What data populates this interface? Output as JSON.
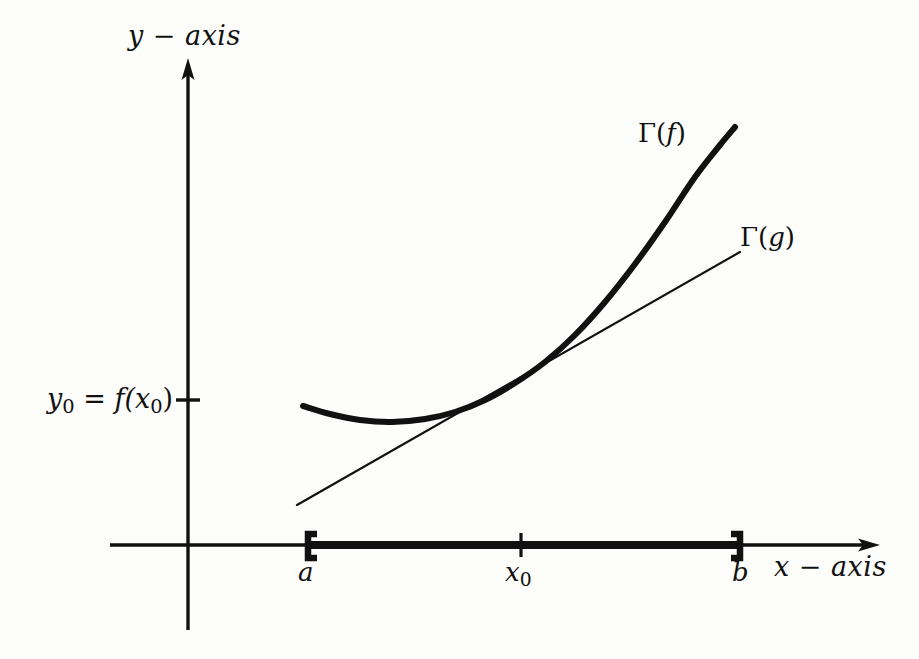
{
  "figure": {
    "background_color": "#fdfdfc",
    "ink_color": "#111111",
    "width": 919,
    "height": 659
  },
  "labels": {
    "y_axis": "y − axis",
    "x_axis": "x − axis",
    "y_value_prefix": "y",
    "y_value_sub": "0",
    "y_value_mid": " = f(x",
    "y_value_sub2": "0",
    "y_value_suffix": ")",
    "point_a": "a",
    "point_b": "b",
    "point_x0_base": "x",
    "point_x0_sub": "0",
    "graph_f_open": "Γ(",
    "graph_f_name": "f",
    "graph_f_close": ")",
    "graph_g_open": "Γ(",
    "graph_g_name": "g",
    "graph_g_close": ")"
  },
  "chart_data": {
    "type": "line",
    "title": "",
    "xlabel": "x − axis",
    "ylabel": "y − axis",
    "grid": false,
    "legend_position": "inline-annotation",
    "axes": {
      "origin_px": [
        188,
        545
      ],
      "x_axis_from_px": [
        110,
        545
      ],
      "x_axis_to_px": [
        878,
        545
      ],
      "y_axis_from_px": [
        188,
        630
      ],
      "y_axis_to_px": [
        188,
        60
      ],
      "x_arrow": true,
      "y_arrow": true
    },
    "ticks": {
      "x": [
        {
          "label": "a",
          "px": 310,
          "style": "bracket-open"
        },
        {
          "label": "x0",
          "px": 521,
          "style": "tick"
        },
        {
          "label": "b",
          "px": 739,
          "style": "bracket-close"
        }
      ],
      "y": [
        {
          "label": "y0 = f(x0)",
          "px": 400,
          "style": "tick"
        }
      ]
    },
    "domain_segment": {
      "from_px": 310,
      "to_px": 739,
      "y_px": 545,
      "description": "thick closed interval [a, b] drawn on the x-axis"
    },
    "series": [
      {
        "name": "Γ(f)",
        "style": "thick-curve",
        "stroke_width": 6,
        "label_px": [
          638,
          118
        ],
        "description": "convex curve with minimum near x just right of a, rising steeply toward b; tangent to Γ(g) at x0",
        "points_px": [
          [
            303,
            406
          ],
          [
            330,
            414
          ],
          [
            360,
            420
          ],
          [
            392,
            422
          ],
          [
            425,
            419
          ],
          [
            455,
            412
          ],
          [
            485,
            400
          ],
          [
            515,
            383
          ],
          [
            545,
            362
          ],
          [
            575,
            335
          ],
          [
            605,
            302
          ],
          [
            635,
            264
          ],
          [
            665,
            222
          ],
          [
            695,
            177
          ],
          [
            720,
            145
          ],
          [
            735,
            127
          ]
        ]
      },
      {
        "name": "Γ(g)",
        "style": "thin-line",
        "stroke_width": 2.2,
        "label_px": [
          740,
          222
        ],
        "description": "straight tangent line to Γ(f) at the point (x0, y0)",
        "points_px": [
          [
            297,
            505
          ],
          [
            740,
            252
          ]
        ]
      }
    ],
    "annotations": [
      {
        "text": "Γ(f)",
        "px": [
          638,
          118
        ],
        "target": "thick curve"
      },
      {
        "text": "Γ(g)",
        "px": [
          740,
          222
        ],
        "target": "thin tangent line"
      },
      {
        "text": "y0 = f(x0)",
        "px": [
          47,
          383
        ],
        "target": "y-axis tick"
      },
      {
        "text": "a",
        "px": [
          298,
          557
        ],
        "target": "x-axis left bracket"
      },
      {
        "text": "x0",
        "px": [
          505,
          557
        ],
        "target": "x-axis middle tick"
      },
      {
        "text": "b",
        "px": [
          732,
          557
        ],
        "target": "x-axis right bracket"
      }
    ]
  }
}
